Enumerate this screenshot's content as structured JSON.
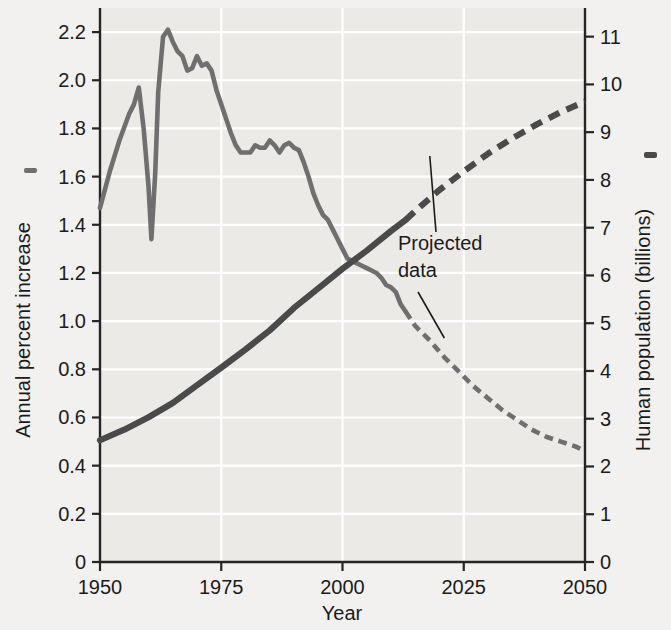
{
  "chart_data": {
    "type": "line",
    "title": "",
    "xlabel": "Year",
    "ylabel_left": "Annual percent increase",
    "ylabel_right": "Human population (billions)",
    "xlim": [
      1950,
      2050
    ],
    "xticks": [
      1950,
      1975,
      2000,
      2025,
      2050
    ],
    "xtick_labels": [
      "1950",
      "1975",
      "2000",
      "2025",
      "2050"
    ],
    "ylim_left": [
      0,
      2.3
    ],
    "yticks_left": [
      0,
      0.2,
      0.4,
      0.6,
      0.8,
      1.0,
      1.2,
      1.4,
      1.6,
      1.8,
      2.0,
      2.2
    ],
    "ytick_labels_left": [
      "0",
      "0.2",
      "0.4",
      "0.6",
      "0.8",
      "1.0",
      "1.2",
      "1.4",
      "1.6",
      "1.8",
      "2.0",
      "2.2"
    ],
    "ylim_right": [
      0,
      11.6
    ],
    "yticks_right": [
      0,
      1,
      2,
      3,
      4,
      5,
      6,
      7,
      8,
      9,
      10,
      11
    ],
    "ytick_labels_right": [
      "0",
      "1",
      "2",
      "3",
      "4",
      "5",
      "6",
      "7",
      "8",
      "9",
      "10",
      "11"
    ],
    "grid": true,
    "grid_color": "#ffffff",
    "plot_background": "#eceae7",
    "legend_position": "axis-titles",
    "annotations": [
      {
        "text": "Projected data",
        "text_lines": [
          "Projected",
          "data"
        ],
        "x": 2023,
        "y_left": 1.22,
        "leader_targets": [
          {
            "series": "human_population",
            "x": 2018,
            "y": 8.5
          },
          {
            "series": "annual_percent_increase",
            "x": 2021,
            "y": 0.93
          }
        ]
      }
    ],
    "series": [
      {
        "name": "Annual percent increase",
        "axis": "left",
        "color": "#6f6f6f",
        "style": "solid-then-dashed",
        "dash_starts_at": 2013,
        "units": "percent per year",
        "points": [
          [
            1950,
            1.47
          ],
          [
            1952,
            1.62
          ],
          [
            1954,
            1.75
          ],
          [
            1956,
            1.86
          ],
          [
            1957,
            1.9
          ],
          [
            1958,
            1.97
          ],
          [
            1959,
            1.8
          ],
          [
            1960,
            1.56
          ],
          [
            1960.6,
            1.34
          ],
          [
            1961.4,
            1.62
          ],
          [
            1962,
            1.95
          ],
          [
            1963,
            2.18
          ],
          [
            1964,
            2.21
          ],
          [
            1965,
            2.16
          ],
          [
            1966,
            2.12
          ],
          [
            1967,
            2.1
          ],
          [
            1968,
            2.04
          ],
          [
            1969,
            2.05
          ],
          [
            1970,
            2.1
          ],
          [
            1971,
            2.06
          ],
          [
            1972,
            2.07
          ],
          [
            1973,
            2.04
          ],
          [
            1974,
            1.96
          ],
          [
            1975,
            1.9
          ],
          [
            1976,
            1.84
          ],
          [
            1977,
            1.78
          ],
          [
            1978,
            1.73
          ],
          [
            1979,
            1.7
          ],
          [
            1980,
            1.7
          ],
          [
            1981,
            1.7
          ],
          [
            1982,
            1.73
          ],
          [
            1983,
            1.72
          ],
          [
            1984,
            1.72
          ],
          [
            1985,
            1.75
          ],
          [
            1986,
            1.73
          ],
          [
            1987,
            1.7
          ],
          [
            1988,
            1.73
          ],
          [
            1989,
            1.74
          ],
          [
            1990,
            1.72
          ],
          [
            1991,
            1.71
          ],
          [
            1992,
            1.66
          ],
          [
            1993,
            1.6
          ],
          [
            1994,
            1.53
          ],
          [
            1995,
            1.48
          ],
          [
            1996,
            1.44
          ],
          [
            1997,
            1.42
          ],
          [
            1998,
            1.38
          ],
          [
            1999,
            1.34
          ],
          [
            2000,
            1.3
          ],
          [
            2001,
            1.26
          ],
          [
            2002,
            1.25
          ],
          [
            2003,
            1.24
          ],
          [
            2004,
            1.23
          ],
          [
            2005,
            1.22
          ],
          [
            2006,
            1.21
          ],
          [
            2007,
            1.2
          ],
          [
            2008,
            1.18
          ],
          [
            2009,
            1.15
          ],
          [
            2010,
            1.14
          ],
          [
            2011,
            1.12
          ],
          [
            2012,
            1.07
          ],
          [
            2013,
            1.04
          ],
          [
            2015,
            0.98
          ],
          [
            2018,
            0.92
          ],
          [
            2021,
            0.85
          ],
          [
            2024,
            0.79
          ],
          [
            2027,
            0.73
          ],
          [
            2030,
            0.68
          ],
          [
            2033,
            0.63
          ],
          [
            2036,
            0.59
          ],
          [
            2039,
            0.55
          ],
          [
            2042,
            0.52
          ],
          [
            2045,
            0.5
          ],
          [
            2048,
            0.48
          ],
          [
            2050,
            0.46
          ]
        ]
      },
      {
        "name": "Human population",
        "axis": "right",
        "color": "#4a4a4a",
        "style": "solid-then-dashed",
        "dash_starts_at": 2013,
        "units": "billions",
        "points": [
          [
            1950,
            2.55
          ],
          [
            1955,
            2.77
          ],
          [
            1960,
            3.03
          ],
          [
            1965,
            3.33
          ],
          [
            1970,
            3.7
          ],
          [
            1975,
            4.07
          ],
          [
            1980,
            4.45
          ],
          [
            1985,
            4.85
          ],
          [
            1990,
            5.32
          ],
          [
            1995,
            5.73
          ],
          [
            2000,
            6.14
          ],
          [
            2005,
            6.52
          ],
          [
            2010,
            6.93
          ],
          [
            2013,
            7.16
          ],
          [
            2015,
            7.35
          ],
          [
            2020,
            7.79
          ],
          [
            2025,
            8.18
          ],
          [
            2030,
            8.55
          ],
          [
            2035,
            8.87
          ],
          [
            2040,
            9.16
          ],
          [
            2045,
            9.42
          ],
          [
            2050,
            9.64
          ]
        ]
      }
    ]
  },
  "labels": {
    "x_axis_title": "Year",
    "y_left_title": "Annual percent increase",
    "y_right_title": "Human population (billions)",
    "annotation_line1": "Projected",
    "annotation_line2": "data",
    "xticks": [
      "1950",
      "1975",
      "2000",
      "2025",
      "2050"
    ],
    "yticks_left": [
      "2.2",
      "2.0",
      "1.8",
      "1.6",
      "1.4",
      "1.2",
      "1.0",
      "0.8",
      "0.6",
      "0.4",
      "0.2",
      "0"
    ],
    "yticks_right": [
      "11",
      "10",
      "9",
      "8",
      "7",
      "6",
      "5",
      "4",
      "3",
      "2",
      "1",
      "0"
    ]
  },
  "colors": {
    "growth_line": "#6f6f6f",
    "population_line": "#4a4a4a",
    "axis": "#252525",
    "grid": "#ffffff",
    "plot_bg": "#eceae7",
    "page_bg": "#f2f1ef",
    "text": "#1b1b1b"
  }
}
